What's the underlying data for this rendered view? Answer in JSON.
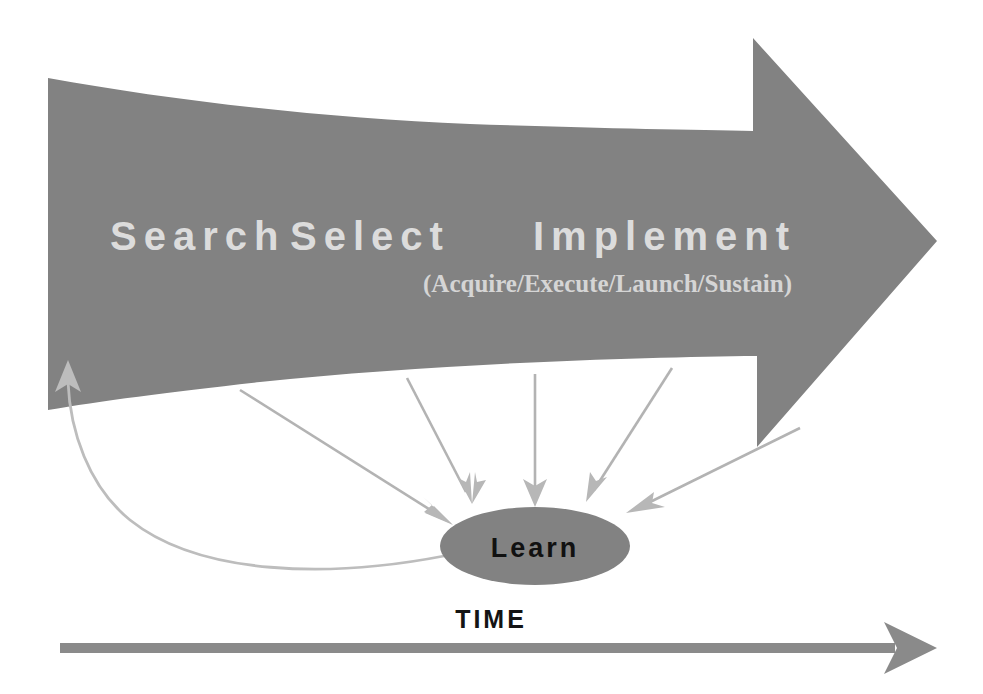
{
  "diagram": {
    "title": "Innovation Process: Search / Select / Implement with Learn feedback loop",
    "colors": {
      "arrow_body": "#828282",
      "node_fill": "#828282",
      "phase_text": "#dcdcdc",
      "sub_text": "#d5d5d5",
      "node_text": "#111111",
      "axis_text": "#141414",
      "connector": "#b3b3b3",
      "background": "#ffffff"
    },
    "main_arrow": {
      "name": "process-arrow",
      "phases": [
        {
          "id": "search",
          "label": "Search",
          "x": 110,
          "y": 250
        },
        {
          "id": "select",
          "label": "Select",
          "x": 290,
          "y": 250
        },
        {
          "id": "implement",
          "label": "Implement",
          "x": 533,
          "y": 250
        }
      ],
      "sub_label": "(Acquire/Execute/Launch/Sustain)",
      "sub_label_x": 423,
      "sub_label_y": 292
    },
    "learn_node": {
      "label": "Learn",
      "cx": 535,
      "cy": 546,
      "rx": 95,
      "ry": 39
    },
    "feedback_loop": {
      "name": "learn-to-search-feedback",
      "from": "Learn",
      "to": "Search"
    },
    "learning_arrows": [
      {
        "id": "learn-arrow-1",
        "from_phase": "Search",
        "x1": 240,
        "y1": 390,
        "x2": 452,
        "y2": 524
      },
      {
        "id": "learn-arrow-2",
        "from_phase": "Select",
        "x1": 407,
        "y1": 378,
        "x2": 472,
        "y2": 500
      },
      {
        "id": "learn-arrow-3",
        "from_phase": "Implement",
        "x1": 535,
        "y1": 374,
        "x2": 535,
        "y2": 504
      },
      {
        "id": "learn-arrow-4",
        "from_phase": "Implement",
        "x1": 672,
        "y1": 368,
        "x2": 588,
        "y2": 500
      },
      {
        "id": "learn-arrow-5",
        "from_phase": "Implement",
        "x1": 800,
        "y1": 428,
        "x2": 628,
        "y2": 512
      }
    ],
    "time_axis": {
      "label": "TIME",
      "label_x": 491,
      "label_y": 628,
      "shaft_x1": 60,
      "shaft_x2": 895,
      "tip_x": 937,
      "y": 648
    }
  }
}
